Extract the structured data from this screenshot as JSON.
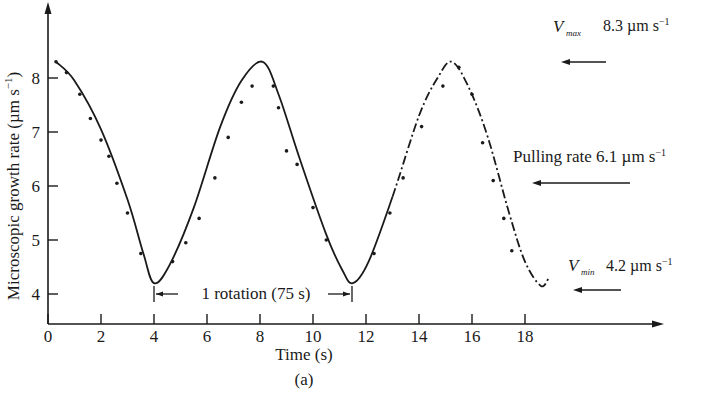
{
  "chart_data": {
    "type": "line",
    "title": "",
    "panel_label": "(a)",
    "xlabel": "Time (s)",
    "ylabel": "Microscopic growth rate (µm s⁻¹)",
    "xlim": [
      0,
      20
    ],
    "ylim": [
      3.5,
      9
    ],
    "x_ticks": [
      0,
      2,
      4,
      6,
      8,
      10,
      12,
      14,
      16,
      18
    ],
    "x_tick_labels": [
      "0",
      "2",
      "4",
      "6",
      "8",
      "10",
      "12",
      "14",
      "16",
      "18"
    ],
    "y_ticks": [
      4,
      5,
      6,
      7,
      8
    ],
    "y_tick_labels": [
      "4",
      "5",
      "6",
      "7",
      "8"
    ],
    "grid": false,
    "legend": "none",
    "series": [
      {
        "name": "Microscopic growth rate (fitted curve)",
        "style": "solid then dash-dot",
        "x": [
          0.3,
          1.0,
          2.0,
          3.0,
          3.6,
          4.0,
          4.6,
          5.5,
          6.5,
          7.3,
          8.1,
          8.7,
          9.5,
          10.5,
          11.1,
          11.5,
          12.1,
          13.0,
          14.0,
          14.7,
          15.25,
          15.9,
          16.6,
          17.4,
          18.0,
          18.6,
          18.9
        ],
        "y": [
          8.3,
          7.95,
          7.05,
          5.75,
          4.75,
          4.2,
          4.55,
          5.6,
          7.1,
          7.95,
          8.3,
          7.7,
          6.5,
          5.1,
          4.45,
          4.2,
          4.6,
          5.8,
          7.3,
          8.0,
          8.3,
          7.8,
          6.9,
          5.5,
          4.6,
          4.15,
          4.3
        ]
      },
      {
        "name": "Measured points",
        "style": "dots",
        "x": [
          0.3,
          0.7,
          1.2,
          1.6,
          2.0,
          2.3,
          2.6,
          3.0,
          3.5,
          4.7,
          5.2,
          5.7,
          6.3,
          6.8,
          7.3,
          7.7,
          8.5,
          8.7,
          9.0,
          9.4,
          10.0,
          10.5,
          12.3,
          12.9,
          13.4,
          14.1,
          14.9,
          15.5,
          16.0,
          16.4,
          16.8,
          17.2,
          17.5
        ],
        "y": [
          8.3,
          8.1,
          7.7,
          7.25,
          6.85,
          6.55,
          6.05,
          5.5,
          4.75,
          4.6,
          4.95,
          5.4,
          6.15,
          6.9,
          7.55,
          7.85,
          7.85,
          7.45,
          6.65,
          6.4,
          5.6,
          5.0,
          4.75,
          5.5,
          6.15,
          7.1,
          7.85,
          8.2,
          7.7,
          6.8,
          6.1,
          5.4,
          4.8
        ]
      }
    ],
    "annotations": [
      {
        "label": "V_max",
        "sub": "max",
        "text": "8.3 µm s⁻¹",
        "value": 8.3,
        "arrow": "left"
      },
      {
        "label": "Pulling rate",
        "text": "6.1 µm s⁻¹",
        "value": 6.1,
        "arrow": "left"
      },
      {
        "label": "V_min",
        "sub": "min",
        "text": "4.2 µm s⁻¹",
        "value": 4.2,
        "arrow": "left"
      },
      {
        "label": "1 rotation (75 s)",
        "from_x": 4.0,
        "to_x": 11.5,
        "type": "span"
      }
    ]
  },
  "labels": {
    "xlabel": "Time (s)",
    "panel": "(a)",
    "ylabel": "Microscopic growth rate (µm s",
    "ylabel_sup": "−1",
    "ylabel_close": ")",
    "vmax_V": "V",
    "vmax_sub": "max",
    "vmax_text": "8.3 µm s",
    "vmax_sup": "−1",
    "pull_text": "Pulling rate 6.1 µm s",
    "pull_sup": "−1",
    "vmin_V": "V",
    "vmin_sub": "min",
    "vmin_text": "4.2 µm s",
    "vmin_sup": "−1",
    "rotation": "1 rotation (75 s)"
  }
}
